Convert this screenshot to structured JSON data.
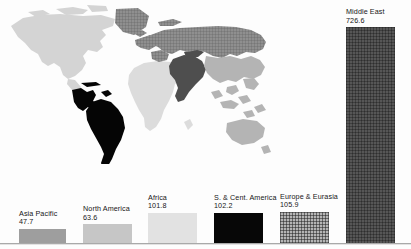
{
  "chart_data": {
    "type": "bar",
    "title": "",
    "xlabel": "",
    "ylabel": "",
    "ylim": [
      0,
      760
    ],
    "grid": false,
    "legend": "none",
    "annotation": "Each bar is labelled above with the region name and its value; the world map behind the bars shades every region with the same fill used by its bar.",
    "categories": [
      "Asia Pacific",
      "North America",
      "Africa",
      "S. & Cent. America",
      "Europe & Eurasia",
      "Middle East"
    ],
    "values": [
      47.7,
      63.6,
      101.8,
      102.2,
      105.9,
      726.6
    ],
    "bars": [
      {
        "name": "Asia Pacific",
        "value": 47.7,
        "value_text": "47.7",
        "color": "#9e9e9e",
        "fill": "solid",
        "x": 19,
        "width": 47
      },
      {
        "name": "North America",
        "value": 63.6,
        "value_text": "63.6",
        "color": "#c6c6c6",
        "fill": "solid",
        "x": 83,
        "width": 49
      },
      {
        "name": "Africa",
        "value": 101.8,
        "value_text": "101.8",
        "color": "#e2e2e2",
        "fill": "solid",
        "x": 148,
        "width": 49
      },
      {
        "name": "S. & Cent. America",
        "value": 102.2,
        "value_text": "102.2",
        "color": "#070707",
        "fill": "solid",
        "x": 214,
        "width": 49
      },
      {
        "name": "Europe & Eurasia",
        "value": 105.9,
        "value_text": "105.9",
        "color": "#b5b5b5",
        "fill": "grid",
        "x": 280,
        "width": 49
      },
      {
        "name": "Middle East",
        "value": 726.6,
        "value_text": "726.6",
        "color": "#565656",
        "fill": "grid-dark",
        "x": 346,
        "width": 49
      }
    ]
  },
  "map": {
    "name": "world-map",
    "regions": [
      {
        "name": "North America",
        "fill": "#d4d4d4"
      },
      {
        "name": "S. & Cent. America",
        "fill": "#050505"
      },
      {
        "name": "Africa",
        "fill": "#dcdcdc"
      },
      {
        "name": "Asia Pacific",
        "fill": "#b4b4b4"
      },
      {
        "name": "Middle East",
        "fill": "#4e4e4e"
      },
      {
        "name": "Europe & Eurasia",
        "fill": "#8f8f8f"
      }
    ]
  },
  "palette": {
    "baseline": "#a9a9a9",
    "background": "#fdfdfd",
    "text": "#161616"
  }
}
